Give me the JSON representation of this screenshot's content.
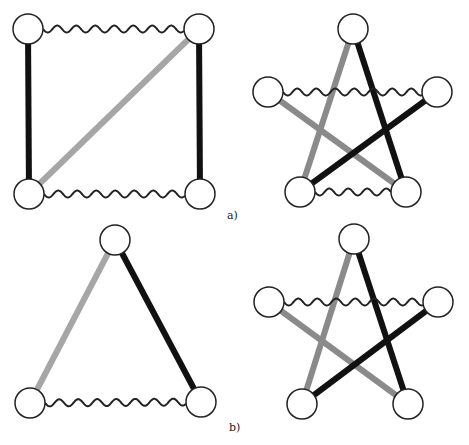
{
  "colors": {
    "black_edge": "#111111",
    "gray_edge": "#a6a6a6",
    "mid_gray_edge": "#8a8a8a",
    "node_fill": "#ffffff",
    "node_stroke": "#222222",
    "wavy": "#222222"
  },
  "node_radius": 15,
  "panels": [
    {
      "label": "a)",
      "label_pos": [
        227,
        219
      ],
      "graphs": [
        {
          "name": "square-graph",
          "nodes": [
            [
              28,
              29
            ],
            [
              199,
              29
            ],
            [
              29,
              194
            ],
            [
              200,
              194
            ]
          ],
          "edges": [
            {
              "from": 0,
              "to": 2,
              "style": "black"
            },
            {
              "from": 1,
              "to": 3,
              "style": "black"
            },
            {
              "from": 1,
              "to": 2,
              "style": "gray"
            },
            {
              "from": 0,
              "to": 1,
              "style": "wavy"
            },
            {
              "from": 2,
              "to": 3,
              "style": "wavy"
            }
          ]
        },
        {
          "name": "star-graph-a",
          "nodes": [
            [
              353,
              29
            ],
            [
              268,
              92
            ],
            [
              437,
              92
            ],
            [
              300,
              192
            ],
            [
              406,
              192
            ]
          ],
          "edges": [
            {
              "from": 0,
              "to": 3,
              "style": "midgray"
            },
            {
              "from": 0,
              "to": 4,
              "style": "black"
            },
            {
              "from": 1,
              "to": 4,
              "style": "midgray"
            },
            {
              "from": 2,
              "to": 3,
              "style": "black"
            },
            {
              "from": 1,
              "to": 2,
              "style": "wavy"
            },
            {
              "from": 3,
              "to": 4,
              "style": "wavy"
            }
          ]
        }
      ]
    },
    {
      "label": "b)",
      "label_pos": [
        229,
        431
      ],
      "graphs": [
        {
          "name": "triangle-graph",
          "nodes": [
            [
              115,
              240
            ],
            [
              30,
              403
            ],
            [
              201,
              402
            ]
          ],
          "edges": [
            {
              "from": 0,
              "to": 1,
              "style": "gray"
            },
            {
              "from": 0,
              "to": 2,
              "style": "black"
            },
            {
              "from": 1,
              "to": 2,
              "style": "wavy"
            }
          ]
        },
        {
          "name": "star-graph-b",
          "nodes": [
            [
              354,
              239
            ],
            [
              269,
              302
            ],
            [
              438,
              302
            ],
            [
              302,
              404
            ],
            [
              408,
              404
            ]
          ],
          "edges": [
            {
              "from": 0,
              "to": 3,
              "style": "midgray"
            },
            {
              "from": 0,
              "to": 4,
              "style": "black"
            },
            {
              "from": 1,
              "to": 4,
              "style": "midgray"
            },
            {
              "from": 2,
              "to": 3,
              "style": "black"
            },
            {
              "from": 1,
              "to": 2,
              "style": "wavy"
            }
          ]
        }
      ]
    }
  ]
}
